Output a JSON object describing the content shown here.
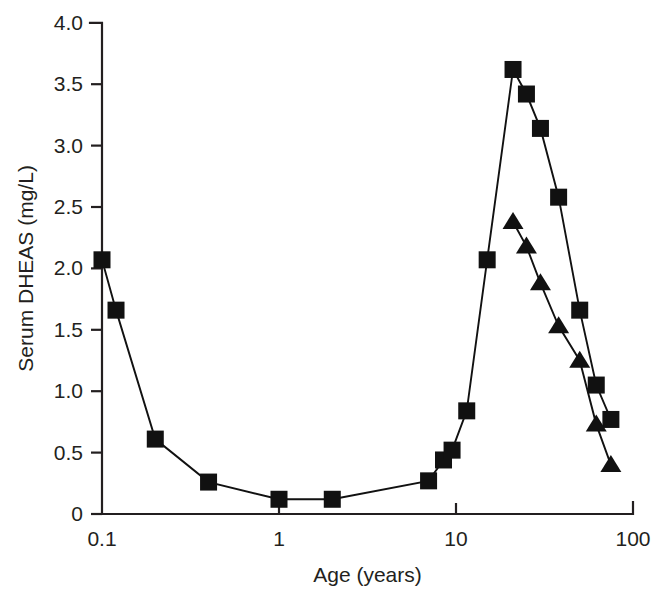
{
  "chart_data": {
    "type": "line",
    "title": "",
    "xlabel": "Age (years)",
    "ylabel": "Serum DHEAS (mg/L)",
    "xscale": "log",
    "xlim": [
      0.1,
      100
    ],
    "ylim": [
      0,
      4.0
    ],
    "grid": false,
    "legend": "none",
    "x_ticks": [
      {
        "value": 0.1,
        "label": "0.1"
      },
      {
        "value": 1,
        "label": "1"
      },
      {
        "value": 10,
        "label": "10"
      },
      {
        "value": 100,
        "label": "100"
      }
    ],
    "y_ticks": [
      {
        "value": 0,
        "label": "0"
      },
      {
        "value": 0.5,
        "label": "0.5"
      },
      {
        "value": 1.0,
        "label": "1.0"
      },
      {
        "value": 1.5,
        "label": "1.5"
      },
      {
        "value": 2.0,
        "label": "2.0"
      },
      {
        "value": 2.5,
        "label": "2.5"
      },
      {
        "value": 3.0,
        "label": "3.0"
      },
      {
        "value": 3.5,
        "label": "3.5"
      },
      {
        "value": 4.0,
        "label": "4.0"
      }
    ],
    "series": [
      {
        "name": "series-squares",
        "marker": "square",
        "color": "#111111",
        "points": [
          {
            "x": 0.1,
            "y": 2.07
          },
          {
            "x": 0.12,
            "y": 1.66
          },
          {
            "x": 0.2,
            "y": 0.61
          },
          {
            "x": 0.4,
            "y": 0.26
          },
          {
            "x": 1.0,
            "y": 0.12
          },
          {
            "x": 2.0,
            "y": 0.12
          },
          {
            "x": 7.0,
            "y": 0.27
          },
          {
            "x": 8.5,
            "y": 0.44
          },
          {
            "x": 9.5,
            "y": 0.52
          },
          {
            "x": 11.5,
            "y": 0.84
          },
          {
            "x": 15.0,
            "y": 2.07
          },
          {
            "x": 21.0,
            "y": 3.62
          },
          {
            "x": 25.0,
            "y": 3.42
          },
          {
            "x": 30.0,
            "y": 3.14
          },
          {
            "x": 38.0,
            "y": 2.58
          },
          {
            "x": 50.0,
            "y": 1.66
          },
          {
            "x": 62.0,
            "y": 1.05
          },
          {
            "x": 75.0,
            "y": 0.77
          }
        ]
      },
      {
        "name": "series-triangles",
        "marker": "triangle",
        "color": "#111111",
        "points": [
          {
            "x": 21.0,
            "y": 2.38
          },
          {
            "x": 25.0,
            "y": 2.18
          },
          {
            "x": 30.0,
            "y": 1.88
          },
          {
            "x": 38.0,
            "y": 1.53
          },
          {
            "x": 50.0,
            "y": 1.25
          },
          {
            "x": 62.0,
            "y": 0.73
          },
          {
            "x": 75.0,
            "y": 0.4
          }
        ]
      }
    ]
  },
  "axes": {
    "y_title": "Serum DHEAS (mg/L)",
    "x_title": "Age (years)"
  }
}
